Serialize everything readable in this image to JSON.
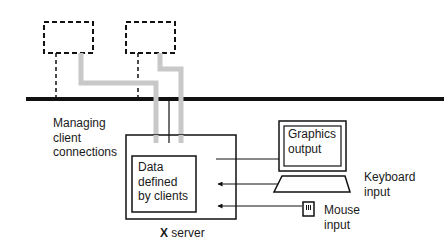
{
  "diagram": {
    "colors": {
      "line": "#111111",
      "ribbon": "#c8c8c8",
      "background": "#ffffff"
    },
    "clients": [
      {
        "id": "client-1",
        "style": "dashed"
      },
      {
        "id": "client-2",
        "style": "dashed"
      }
    ],
    "labels": {
      "managing": "Managing\nclient\nconnections",
      "data_box": "Data\ndefined\nby clients",
      "graphics": "Graphics\noutput",
      "keyboard": "Keyboard\ninput",
      "mouse": "Mouse\ninput",
      "server_prefix": "X",
      "server_suffix": " server"
    },
    "icons": {
      "monitor": "monitor-icon",
      "keyboard": "keyboard-icon",
      "mouse": "mouse-icon"
    }
  }
}
